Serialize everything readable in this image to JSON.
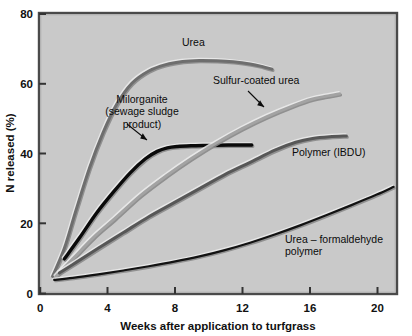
{
  "chart_data": {
    "type": "line",
    "title": "",
    "xlabel": "Weeks after application to turfgrass",
    "ylabel": "N released (%)",
    "xlim": [
      0,
      21.2
    ],
    "ylim": [
      0,
      80
    ],
    "xticks": [
      0,
      4,
      8,
      12,
      16,
      20
    ],
    "yticks": [
      0,
      20,
      40,
      60,
      80
    ],
    "xticklabels": [
      "0",
      "4",
      "8",
      "12",
      "16",
      "20"
    ],
    "yticklabels": [
      "0",
      "20",
      "40",
      "60",
      "80"
    ],
    "grid": false,
    "legend": "inline-annotations",
    "plot_background_color": "#c9c9c9",
    "series": [
      {
        "name": "Urea",
        "color": "#6e6e6e",
        "x": [
          0.8,
          1.5,
          2.2,
          3.0,
          3.8,
          4.6,
          5.5,
          6.5,
          7.5,
          8.5,
          9.5,
          10.5,
          11.5,
          12.5,
          13.2,
          13.8
        ],
        "values": [
          5,
          13,
          24,
          36,
          46,
          54,
          60,
          63.5,
          65.3,
          66.2,
          66.5,
          66.4,
          66.1,
          65.5,
          64.8,
          64.0
        ]
      },
      {
        "name": "Milorganite (sewage sludge product)",
        "color": "#0a0a0a",
        "x": [
          1.5,
          2.4,
          3.4,
          4.4,
          5.4,
          6.3,
          7.0,
          7.6,
          8.2,
          9.0,
          10.0,
          11.2,
          12.6
        ],
        "values": [
          10,
          16,
          23,
          29,
          34.5,
          38.5,
          40.6,
          41.6,
          42.0,
          42.2,
          42.3,
          42.4,
          42.4
        ]
      },
      {
        "name": "Sulfur-coated urea",
        "color": "#a3a3a3",
        "x": [
          1.0,
          2.0,
          3.2,
          4.5,
          6.0,
          7.5,
          9.0,
          10.5,
          12.0,
          13.5,
          15.0,
          16.2,
          17.0,
          17.8
        ],
        "values": [
          5,
          10,
          16,
          21.5,
          28,
          33.5,
          38.5,
          43,
          47,
          50.5,
          53.5,
          55.5,
          56.3,
          57.0
        ]
      },
      {
        "name": "Polymer (IBDU)",
        "color": "#575757",
        "x": [
          1.2,
          2.2,
          3.5,
          5.0,
          6.5,
          8.0,
          9.5,
          11.0,
          12.5,
          14.0,
          15.2,
          16.2,
          17.2,
          18.2
        ],
        "values": [
          6,
          9,
          13,
          17.5,
          22,
          26,
          30,
          34,
          37.5,
          41,
          43.2,
          44.3,
          44.8,
          45.0
        ]
      },
      {
        "name": "Urea - formaldehyde polymer",
        "color": "#121212",
        "x": [
          0.9,
          2.0,
          3.5,
          5.0,
          6.5,
          8.0,
          9.5,
          11.0,
          12.5,
          14.0,
          15.5,
          17.0,
          18.5,
          20.0,
          21.0
        ],
        "values": [
          4,
          4.6,
          5.6,
          6.7,
          7.9,
          9.2,
          10.7,
          12.5,
          14.6,
          17.0,
          19.6,
          22.4,
          25.3,
          28.3,
          30.5
        ]
      }
    ],
    "annotations": [
      {
        "name": "urea-label",
        "lines": [
          "Urea"
        ],
        "x_px": 182,
        "y_px": 46,
        "anchor": "start",
        "arrow": false
      },
      {
        "name": "milorganite-label",
        "lines": [
          "Milorganite",
          "(sewage sludge",
          "product)"
        ],
        "x_px": 142,
        "y_px": 103,
        "anchor": "middle",
        "arrow": true
      },
      {
        "name": "sulfur-coated-urea-label",
        "lines": [
          "Sulfur-coated urea"
        ],
        "x_px": 213,
        "y_px": 84,
        "anchor": "start",
        "arrow": true
      },
      {
        "name": "polymer-ibdu-label",
        "lines": [
          "Polymer (IBDU)"
        ],
        "x_px": 292,
        "y_px": 156,
        "anchor": "start",
        "arrow": false
      },
      {
        "name": "urea-formaldehyde-label",
        "lines": [
          "Urea – formaldehyde",
          "polymer"
        ],
        "x_px": 285,
        "y_px": 243,
        "anchor": "start",
        "arrow": false
      }
    ]
  },
  "axes": {
    "y_title": "N released (%)",
    "x_title": "Weeks after application to turfgrass"
  }
}
